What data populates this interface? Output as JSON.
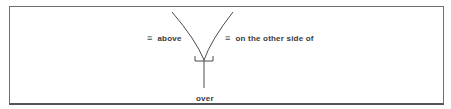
{
  "diagram": {
    "left_label": {
      "symbol": "≡",
      "text": "above"
    },
    "right_label": {
      "symbol": "≡",
      "text": "on the other side of"
    },
    "bottom_label": {
      "text": "over"
    }
  },
  "colors": {
    "line": "#4a4a4a",
    "text": "#3a3a3a",
    "frame": "#6e6e6e"
  }
}
